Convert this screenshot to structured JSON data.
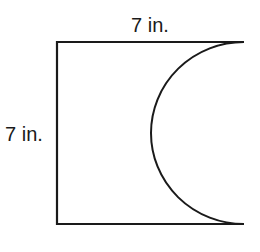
{
  "diagram": {
    "shape": "square with semicircle removed from right side",
    "labels": {
      "top_side": "7 in.",
      "left_side": "7 in."
    },
    "dimensions": {
      "width_in": 7,
      "height_in": 7,
      "semicircle_diameter_in": 7
    },
    "colors": {
      "stroke": "#1a1a1a",
      "background": "#ffffff"
    }
  }
}
